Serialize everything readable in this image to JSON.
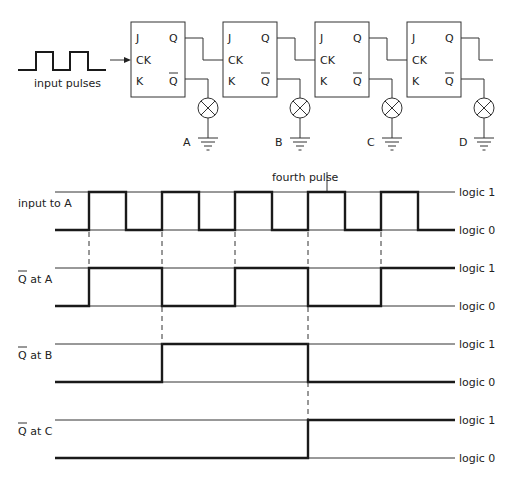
{
  "circuit": {
    "input_label": "input pulses",
    "flipflops": [
      {
        "id": "A",
        "pins": {
          "j": "J",
          "ck": "CK",
          "k": "K",
          "q": "Q",
          "qbar": "Q"
        }
      },
      {
        "id": "B",
        "pins": {
          "j": "J",
          "ck": "CK",
          "k": "K",
          "q": "Q",
          "qbar": "Q"
        }
      },
      {
        "id": "C",
        "pins": {
          "j": "J",
          "ck": "CK",
          "k": "K",
          "q": "Q",
          "qbar": "Q"
        }
      },
      {
        "id": "D",
        "pins": {
          "j": "J",
          "ck": "CK",
          "k": "K",
          "q": "Q",
          "qbar": "Q"
        }
      }
    ],
    "lamp_labels": [
      "A",
      "B",
      "C",
      "D"
    ]
  },
  "timing": {
    "annotation": "fourth pulse",
    "level_high": "logic 1",
    "level_low": "logic 0",
    "signals": [
      {
        "label": "input to A",
        "overbar": false,
        "transitions": [
          89,
          126,
          162,
          199,
          235,
          272,
          308,
          345,
          381,
          418
        ],
        "initial": 0
      },
      {
        "label": "Q at A",
        "overbar": true,
        "transitions": [
          89,
          162,
          235,
          308,
          381
        ],
        "initial": 0
      },
      {
        "label": "Q at B",
        "overbar": true,
        "transitions": [
          162,
          308
        ],
        "initial": 0
      },
      {
        "label": "Q at C",
        "overbar": true,
        "transitions": [
          308
        ],
        "initial": 0
      }
    ]
  }
}
